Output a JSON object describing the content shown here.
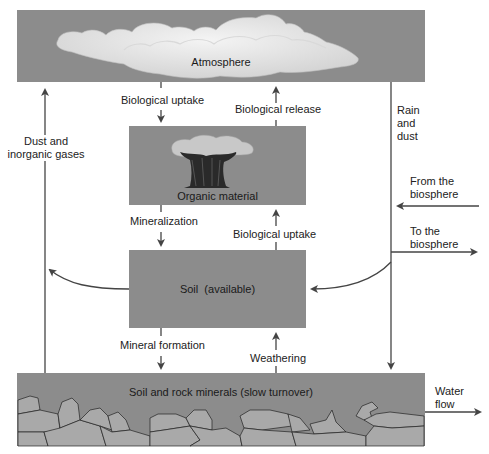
{
  "boxes": {
    "atmosphere": "Atmosphere",
    "organic": "Organic material",
    "soil_available": "Soil  (available)",
    "soil_rock": "Soil and rock minerals (slow turnover)"
  },
  "flows": {
    "bio_uptake_top": "Biological uptake",
    "bio_release": "Biological release",
    "mineralization": "Mineralization",
    "bio_uptake_mid": "Biological uptake",
    "mineral_formation": "Mineral formation",
    "weathering": "Weathering",
    "dust_line1": "Dust and",
    "dust_line2": "inorganic gases",
    "rain_line1": "Rain",
    "rain_line2": "and",
    "rain_line3": "dust",
    "from_line1": "From the",
    "from_line2": "biosphere",
    "to_line1": "To the",
    "to_line2": "biosphere",
    "water_line1": "Water",
    "water_line2": "flow"
  },
  "colors": {
    "box_fill": "#8c8c8c",
    "arrow": "#444444",
    "cloud": "#e6e6e6",
    "rock": "#a9a9a9"
  }
}
